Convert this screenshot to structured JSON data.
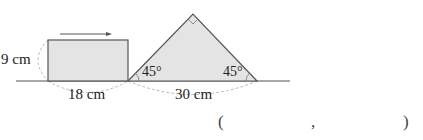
{
  "figure": {
    "rectangle": {
      "height_label": "9 cm",
      "width_label": "18 cm"
    },
    "triangle": {
      "base_label": "30 cm",
      "left_angle": "45°",
      "right_angle": "45°",
      "apex": "right-angle"
    },
    "arrow_direction": "right"
  },
  "answer": {
    "open": "(",
    "separator": ",",
    "close": ")"
  },
  "colors": {
    "fill": "#e4e4e4",
    "stroke": "#555555",
    "dashed": "#bbbbbb"
  }
}
